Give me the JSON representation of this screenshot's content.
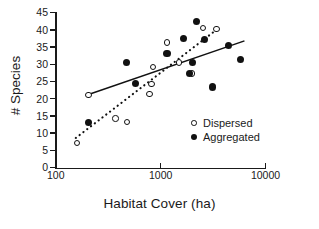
{
  "chart_data": {
    "type": "scatter",
    "title": "",
    "xlabel": "Habitat Cover (ha)",
    "ylabel": "# Species",
    "xscale": "log",
    "yscale": "linear",
    "xlim": [
      100,
      10000
    ],
    "ylim": [
      0,
      45
    ],
    "grid": false,
    "legend_position": "inside-lower-right",
    "xticks": [
      {
        "value": 100,
        "label": "100"
      },
      {
        "value": 1000,
        "label": "1000"
      },
      {
        "value": 10000,
        "label": "10000"
      }
    ],
    "yticks": [
      {
        "value": 0,
        "label": "0"
      },
      {
        "value": 5,
        "label": "5"
      },
      {
        "value": 10,
        "label": "10"
      },
      {
        "value": 15,
        "label": "15"
      },
      {
        "value": 20,
        "label": "20"
      },
      {
        "value": 25,
        "label": "25"
      },
      {
        "value": 30,
        "label": "30"
      },
      {
        "value": 35,
        "label": "35"
      },
      {
        "value": 40,
        "label": "40"
      },
      {
        "value": 45,
        "label": "45"
      }
    ],
    "series": [
      {
        "name": "Dispersed",
        "marker": "open-circle",
        "color": "#111111",
        "points": [
          {
            "x": 160,
            "y": 7.1
          },
          {
            "x": 205,
            "y": 21.1
          },
          {
            "x": 370,
            "y": 14.3
          },
          {
            "x": 480,
            "y": 13.2
          },
          {
            "x": 780,
            "y": 21.4
          },
          {
            "x": 820,
            "y": 24.3
          },
          {
            "x": 840,
            "y": 29.2
          },
          {
            "x": 1150,
            "y": 36.3
          },
          {
            "x": 1500,
            "y": 30.5
          },
          {
            "x": 2000,
            "y": 27.3
          },
          {
            "x": 2550,
            "y": 40.5
          },
          {
            "x": 3400,
            "y": 40.3
          }
        ],
        "trendline": {
          "style": "dotted",
          "x_start": 155,
          "y_start": 8.6,
          "x_end": 3400,
          "y_end": 40.0
        }
      },
      {
        "name": "Aggregated",
        "marker": "filled-circle",
        "color": "#111111",
        "points": [
          {
            "x": 205,
            "y": 13.0
          },
          {
            "x": 470,
            "y": 30.4
          },
          {
            "x": 580,
            "y": 24.5
          },
          {
            "x": 1150,
            "y": 33.2
          },
          {
            "x": 1650,
            "y": 37.4
          },
          {
            "x": 1900,
            "y": 27.4
          },
          {
            "x": 2000,
            "y": 30.6
          },
          {
            "x": 2200,
            "y": 42.4
          },
          {
            "x": 2600,
            "y": 37.3
          },
          {
            "x": 3100,
            "y": 23.4
          },
          {
            "x": 4400,
            "y": 35.5
          },
          {
            "x": 5800,
            "y": 31.4
          }
        ],
        "trendline": {
          "style": "solid",
          "x_start": 205,
          "y_start": 21.2,
          "x_end": 6300,
          "y_end": 36.8
        }
      }
    ]
  }
}
